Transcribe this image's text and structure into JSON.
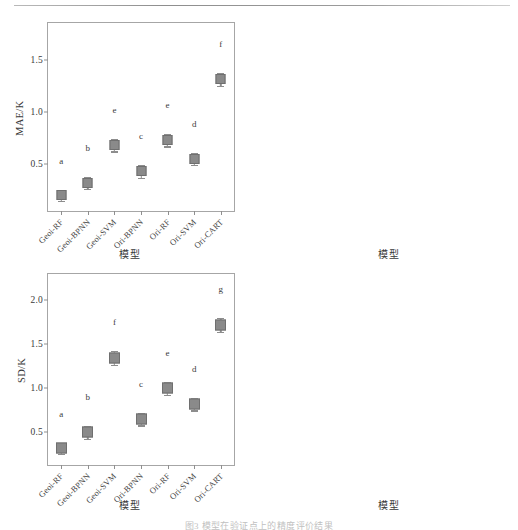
{
  "figure": {
    "caption": "图3  模型在验证点上的精度评价结果",
    "marker_color": "#8a8a8a",
    "frame_color": "#a6a6a6"
  },
  "categories": [
    "Geoi-RF",
    "Geoi-BPNN",
    "Geoi-SVM",
    "Ori-BPNN",
    "Ori-RF",
    "Ori-SVM",
    "Ori-CART"
  ],
  "xtitle": "模型",
  "chart_data": [
    {
      "type": "scatter",
      "panel": "mae",
      "title": "",
      "xlabel": "模型",
      "ylabel": "MAE/K",
      "categories": [
        "Geoi-RF",
        "Geoi-BPNN",
        "Geoi-SVM",
        "Ori-BPNN",
        "Ori-RF",
        "Ori-SVM",
        "Ori-CART"
      ],
      "values": [
        0.2,
        0.32,
        0.68,
        0.43,
        0.73,
        0.55,
        1.31
      ],
      "err_low": [
        0.05,
        0.06,
        0.06,
        0.06,
        0.06,
        0.06,
        0.06
      ],
      "err_high": [
        0.05,
        0.06,
        0.06,
        0.06,
        0.06,
        0.06,
        0.06
      ],
      "sig_letters": [
        "a",
        "b",
        "e",
        "c",
        "e",
        "d",
        "f"
      ],
      "yticks": [
        0.5,
        1.0,
        1.5
      ],
      "ytick_labels": [
        "0.5",
        "1.0",
        "1.5"
      ],
      "ylim": [
        0.05,
        1.85
      ],
      "grid": false
    },
    {
      "type": "scatter",
      "panel": "rmse",
      "title": "",
      "xlabel": "模型",
      "ylabel": "RMSE/K",
      "categories": [
        "Geoi-RF",
        "Geoi-BPNN",
        "Geoi-SVM",
        "Ori-BPNN",
        "Ori-RF",
        "Ori-SVM",
        "Ori-CART"
      ],
      "values": [
        0.33,
        0.5,
        1.36,
        0.65,
        1.01,
        0.82,
        1.82
      ],
      "err_low": [
        0.07,
        0.08,
        0.09,
        0.09,
        0.09,
        0.08,
        0.09
      ],
      "err_high": [
        0.07,
        0.08,
        0.09,
        0.09,
        0.09,
        0.08,
        0.09
      ],
      "sig_letters": [
        "a",
        "b",
        "e",
        "b",
        "d",
        "c",
        "f"
      ],
      "yticks": [
        0.5,
        1.0,
        1.5,
        2.0
      ],
      "ytick_labels": [
        "0.5",
        "1.0",
        "1.5",
        "2.0"
      ],
      "ylim": [
        0.12,
        2.42
      ],
      "grid": false
    },
    {
      "type": "scatter",
      "panel": "sd",
      "title": "",
      "xlabel": "模型",
      "ylabel": "SD/K",
      "categories": [
        "Geoi-RF",
        "Geoi-BPNN",
        "Geoi-SVM",
        "Ori-BPNN",
        "Ori-RF",
        "Ori-SVM",
        "Ori-CART"
      ],
      "values": [
        0.32,
        0.5,
        1.35,
        0.65,
        1.0,
        0.82,
        1.72
      ],
      "err_low": [
        0.06,
        0.07,
        0.08,
        0.07,
        0.07,
        0.07,
        0.08
      ],
      "err_high": [
        0.06,
        0.07,
        0.08,
        0.07,
        0.07,
        0.07,
        0.08
      ],
      "sig_letters": [
        "a",
        "b",
        "f",
        "c",
        "e",
        "d",
        "g"
      ],
      "yticks": [
        0.5,
        1.0,
        1.5,
        2.0
      ],
      "ytick_labels": [
        "0.5",
        "1.0",
        "1.5",
        "2.0"
      ],
      "ylim": [
        0.13,
        2.3
      ],
      "grid": false
    },
    {
      "type": "scatter",
      "panel": "r2",
      "title": "",
      "xlabel": "模型",
      "ylabel": "R²",
      "categories": [
        "Geoi-RF",
        "Geoi-BPNN",
        "Geoi-SVM",
        "Ori-BPNN",
        "Ori-RF",
        "Ori-SVM",
        "Ori-CART"
      ],
      "values": [
        0.997,
        0.992,
        0.935,
        0.988,
        0.968,
        0.98,
        0.893
      ],
      "err_low": [
        0.019,
        0.02,
        0.019,
        0.02,
        0.019,
        0.02,
        0.021
      ],
      "err_high": [
        0.019,
        0.02,
        0.019,
        0.02,
        0.019,
        0.02,
        0.019
      ],
      "sig_letters": [
        "c",
        "c",
        "b",
        "c",
        "bc",
        "c",
        "a"
      ],
      "yticks": [
        0.9,
        0.95,
        1.0,
        1.05
      ],
      "ytick_labels": [
        "0.90",
        "0.95",
        "1.00",
        "1.05"
      ],
      "ylim": [
        0.868,
        1.058
      ],
      "grid": false
    }
  ]
}
